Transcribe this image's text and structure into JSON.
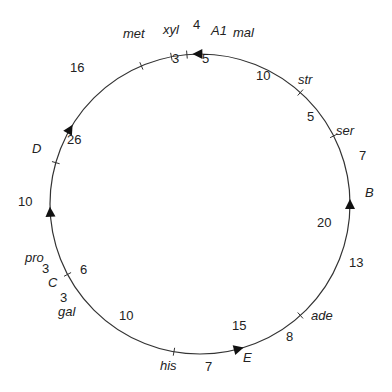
{
  "diagram": {
    "type": "circular-genetic-map",
    "line_color": "#333333",
    "text_color": "#222222",
    "genes": [
      {
        "name": "mal",
        "angle": 95
      },
      {
        "name": "str",
        "angle": 48
      },
      {
        "name": "ser",
        "angle": 27
      },
      {
        "name": "ade",
        "angle": -48
      },
      {
        "name": "his",
        "angle": -100
      },
      {
        "name": "gal",
        "angle": -152
      },
      {
        "name": "pro",
        "angle": -196
      },
      {
        "name": "met",
        "angle": 113
      },
      {
        "name": "xyl",
        "angle": 101
      }
    ],
    "origins": [
      {
        "name": "A1",
        "angle": 91,
        "direction": "ccw"
      },
      {
        "name": "B",
        "angle": 0,
        "direction": "ccw"
      },
      {
        "name": "E",
        "angle": -75,
        "direction": "ccw"
      },
      {
        "name": "C",
        "angle": -177,
        "direction": "cw"
      },
      {
        "name": "D",
        "angle": 150,
        "direction": "cw"
      }
    ],
    "distances": [
      {
        "value": "4",
        "pos": [
          200,
          24
        ]
      },
      {
        "value": "5",
        "pos": [
          206,
          62
        ]
      },
      {
        "value": "3",
        "pos": [
          176,
          61
        ]
      },
      {
        "value": "10",
        "pos": [
          263,
          78
        ]
      },
      {
        "value": "5",
        "pos": [
          307,
          119
        ]
      },
      {
        "value": "7",
        "pos": [
          364,
          158
        ]
      },
      {
        "value": "20",
        "pos": [
          330,
          226
        ]
      },
      {
        "value": "13",
        "pos": [
          357,
          267
        ]
      },
      {
        "value": "8",
        "pos": [
          290,
          339
        ]
      },
      {
        "value": "15",
        "pos": [
          238,
          328
        ]
      },
      {
        "value": "7",
        "pos": [
          209,
          370
        ]
      },
      {
        "value": "10",
        "pos": [
          127,
          319
        ]
      },
      {
        "value": "6",
        "pos": [
          84,
          272
        ]
      },
      {
        "value": "3",
        "pos": [
          46,
          271
        ]
      },
      {
        "value": "3",
        "pos": [
          63,
          303
        ]
      },
      {
        "value": "10",
        "pos": [
          27,
          203
        ]
      },
      {
        "value": "26",
        "pos": [
          76,
          142
        ]
      },
      {
        "value": "16",
        "pos": [
          78,
          70
        ]
      }
    ]
  }
}
